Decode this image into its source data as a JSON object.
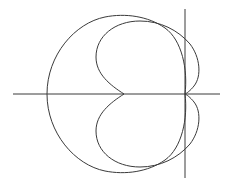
{
  "diagram": {
    "type": "polar-curves",
    "background": "#ffffff",
    "stroke_color": "#3a3a3a",
    "axes": {
      "horizontal": {
        "x1": 13,
        "y1": 94,
        "x2": 220,
        "y2": 94
      },
      "vertical": {
        "x1": 185,
        "y1": 9,
        "x2": 185,
        "y2": 178
      },
      "origin": {
        "x": 185,
        "y": 94
      }
    },
    "curves": [
      {
        "name": "outer-cardioid",
        "description": "Cardioid-like closed curve with cusp at origin, extending left",
        "leftmost_x": 47,
        "top_y": 15,
        "bottom_y": 173
      },
      {
        "name": "inner-two-lobe-curve",
        "description": "Two-lobed curve symmetric about horizontal axis, cusps at origin and at (124,94)",
        "inner_cusp": {
          "x": 124,
          "y": 94
        },
        "leftmost_x": 96,
        "rightmost_x": 200,
        "top_y": 21,
        "bottom_y": 167
      }
    ]
  }
}
